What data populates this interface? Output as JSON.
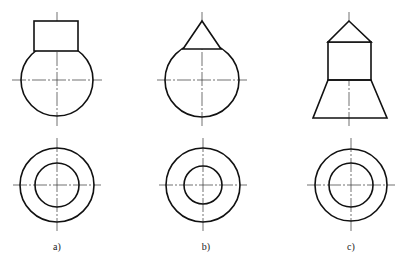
{
  "figure": {
    "stroke_color": "#111111",
    "centerline_color": "#333333",
    "panels": [
      {
        "id": "a",
        "label": "a)",
        "label_pos": [
          57,
          249
        ],
        "front_view": {
          "shape": "cylinder on sphere",
          "rect": {
            "x": 34,
            "y": 21,
            "w": 44,
            "h": 30
          },
          "circle": {
            "cx": 57,
            "cy": 80,
            "r": 36
          }
        },
        "top_view": {
          "cx": 57,
          "cy": 185,
          "outer_r": 37,
          "inner_r": 22
        }
      },
      {
        "id": "b",
        "label": "b)",
        "label_pos": [
          206,
          249
        ],
        "front_view": {
          "shape": "cone on sphere",
          "triangle": [
            [
              202,
              21
            ],
            [
              183,
              49
            ],
            [
              221,
              49
            ]
          ],
          "circle": {
            "cx": 202,
            "cy": 80,
            "r": 37
          }
        },
        "top_view": {
          "cx": 203,
          "cy": 185,
          "outer_r": 37,
          "inner_r": 19
        }
      },
      {
        "id": "c",
        "label": "c)",
        "label_pos": [
          351,
          249
        ],
        "front_view": {
          "shape": "cone on cylinder on frustum",
          "triangle": [
            [
              349,
              21
            ],
            [
              328,
              42
            ],
            [
              371,
              42
            ]
          ],
          "rect": {
            "x": 328,
            "y": 42,
            "w": 43,
            "h": 38
          },
          "trapezoid": [
            [
              328,
              80
            ],
            [
              371,
              80
            ],
            [
              387,
              118
            ],
            [
              313,
              118
            ]
          ]
        },
        "top_view": {
          "cx": 351,
          "cy": 185,
          "outer_r": 36,
          "inner_r": 22
        }
      }
    ]
  }
}
